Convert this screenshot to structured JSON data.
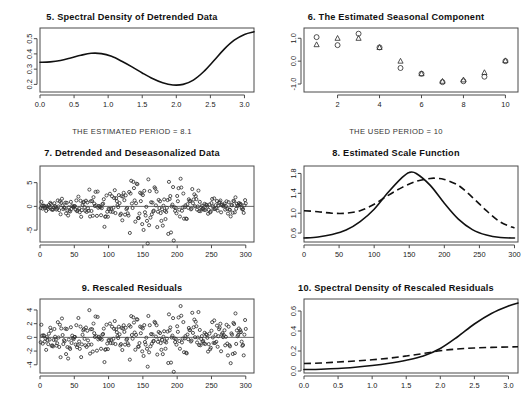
{
  "figure": {
    "background": "#ffffff",
    "ink": "#111111",
    "panel_count": 6
  },
  "captions": {
    "estimated_period": "THE ESTIMATED PERIOD = 8.1",
    "used_period": "THE USED PERIOD = 10"
  },
  "chart_data": [
    {
      "id": "panel5",
      "type": "line",
      "title": "5. Spectral Density of Detrended Data",
      "xlabel": "",
      "ylabel": "",
      "xlim": [
        0.0,
        3.14
      ],
      "ylim": [
        0.15,
        0.57
      ],
      "xticks": [
        0.0,
        0.5,
        1.0,
        1.5,
        2.0,
        2.5,
        3.0
      ],
      "xticklabels": [
        "0.0",
        "0.5",
        "1.0",
        "1.5",
        "2.0",
        "2.5",
        "3.0"
      ],
      "yticks": [
        0.2,
        0.3,
        0.4,
        0.5
      ],
      "yticklabels": [
        "0.2",
        "0.3",
        "0.4",
        "0.5"
      ],
      "grid": false,
      "legend": "none",
      "series": [
        {
          "name": "spectral density",
          "style": "solid",
          "x": [
            0.0,
            0.15,
            0.3,
            0.45,
            0.6,
            0.75,
            0.9,
            1.05,
            1.2,
            1.35,
            1.5,
            1.65,
            1.8,
            1.95,
            2.1,
            2.25,
            2.4,
            2.55,
            2.7,
            2.85,
            3.0,
            3.14
          ],
          "y": [
            0.345,
            0.348,
            0.357,
            0.373,
            0.391,
            0.404,
            0.402,
            0.384,
            0.352,
            0.315,
            0.275,
            0.238,
            0.21,
            0.196,
            0.2,
            0.228,
            0.283,
            0.355,
            0.43,
            0.49,
            0.528,
            0.545
          ]
        }
      ]
    },
    {
      "id": "panel6",
      "type": "scatter",
      "title": "6. The Estimated Seasonal Component",
      "xlabel": "",
      "ylabel": "",
      "xlim": [
        0.4,
        10.6
      ],
      "ylim": [
        -1.35,
        1.45
      ],
      "xticks": [
        2,
        4,
        6,
        8,
        10
      ],
      "xticklabels": [
        "2",
        "4",
        "6",
        "8",
        "10"
      ],
      "yticks": [
        -1.0,
        0.0,
        1.0
      ],
      "yticklabels": [
        "-1.0",
        "0.0",
        "1.0"
      ],
      "grid": false,
      "legend": "none",
      "series": [
        {
          "name": "circles",
          "marker": "circle",
          "x": [
            1,
            2,
            3,
            4,
            5,
            6,
            7,
            8,
            9,
            10
          ],
          "y": [
            1.05,
            0.7,
            1.2,
            0.6,
            -0.3,
            -0.55,
            -0.92,
            -0.88,
            -0.68,
            0.0
          ]
        },
        {
          "name": "triangles",
          "marker": "triangle",
          "x": [
            1,
            2,
            3,
            4,
            5,
            6,
            7,
            8,
            9,
            10
          ],
          "y": [
            0.72,
            1.0,
            1.0,
            0.6,
            0.0,
            -0.55,
            -0.88,
            -0.82,
            -0.5,
            0.02
          ]
        }
      ]
    },
    {
      "id": "panel7",
      "type": "scatter",
      "title": "7. Detrended and Deseasonalized Data",
      "xlabel": "",
      "ylabel": "",
      "xlim": [
        0,
        312
      ],
      "ylim": [
        -7.5,
        8.5
      ],
      "xticks": [
        0,
        50,
        100,
        150,
        200,
        250,
        300
      ],
      "xticklabels": [
        "0",
        "50",
        "100",
        "150",
        "200",
        "250",
        "300"
      ],
      "yticks": [
        -5,
        0,
        5
      ],
      "yticklabels": [
        "-5",
        "0",
        "5"
      ],
      "grid": false,
      "legend": "none",
      "reference_line": 0,
      "n_points": 300,
      "noise_scale_profile": "rises to a maximum near index 150-230 then falls",
      "series": [
        {
          "name": "detrended deseasonalized residuals",
          "marker": "circle",
          "description": "~300 open circles scattered about zero; spread widest near index 150-235 with extremes near +7 at 205 and -6 at 157"
        }
      ]
    },
    {
      "id": "panel8",
      "type": "line",
      "title": "8. Estimated Scale Function",
      "xlabel": "",
      "ylabel": "",
      "xlim": [
        0,
        305
      ],
      "ylim": [
        0.42,
        1.95
      ],
      "xticks": [
        0,
        50,
        100,
        150,
        200,
        250,
        300
      ],
      "xticklabels": [
        "0",
        "50",
        "100",
        "150",
        "200",
        "250",
        "300"
      ],
      "yticks": [
        0.6,
        1.0,
        1.4,
        1.8
      ],
      "yticklabels": [
        "0.6",
        "1.0",
        "1.4",
        "1.8"
      ],
      "grid": false,
      "legend": "none",
      "series": [
        {
          "name": "true scale function",
          "style": "solid",
          "x": [
            0,
            20,
            40,
            60,
            80,
            100,
            120,
            140,
            150,
            160,
            180,
            200,
            220,
            240,
            260,
            280,
            300
          ],
          "y": [
            0.5,
            0.52,
            0.57,
            0.66,
            0.83,
            1.08,
            1.42,
            1.72,
            1.82,
            1.8,
            1.56,
            1.2,
            0.88,
            0.67,
            0.56,
            0.51,
            0.5
          ]
        },
        {
          "name": "estimated scale function",
          "style": "dashed",
          "x": [
            0,
            20,
            40,
            60,
            80,
            100,
            120,
            140,
            160,
            180,
            190,
            200,
            220,
            240,
            260,
            280,
            300
          ],
          "y": [
            1.05,
            1.03,
            1.0,
            1.0,
            1.05,
            1.18,
            1.36,
            1.52,
            1.64,
            1.7,
            1.7,
            1.68,
            1.56,
            1.32,
            1.05,
            0.82,
            0.7
          ]
        }
      ]
    },
    {
      "id": "panel9",
      "type": "scatter",
      "title": "9. Rescaled Residuals",
      "xlabel": "",
      "ylabel": "",
      "xlim": [
        0,
        312
      ],
      "ylim": [
        -5.2,
        5.6
      ],
      "xticks": [
        0,
        50,
        100,
        150,
        200,
        250,
        300
      ],
      "xticklabels": [
        "0",
        "50",
        "100",
        "150",
        "200",
        "250",
        "300"
      ],
      "yticks": [
        -4,
        -2,
        0,
        2,
        4
      ],
      "yticklabels": [
        "-4",
        "-2",
        "0",
        "2",
        "4"
      ],
      "grid": false,
      "legend": "none",
      "reference_line": 0,
      "n_points": 300,
      "series": [
        {
          "name": "rescaled residuals",
          "marker": "circle",
          "description": "~300 open circles roughly homoscedastic about zero, extremes near +5 at 205 and -4.6 at 157"
        }
      ]
    },
    {
      "id": "panel10",
      "type": "line",
      "title": "10. Spectral Density of Rescaled Residuals",
      "xlabel": "",
      "ylabel": "",
      "xlim": [
        0.0,
        3.14
      ],
      "ylim": [
        -0.02,
        0.72
      ],
      "xticks": [
        0.0,
        0.5,
        1.0,
        1.5,
        2.0,
        2.5,
        3.0
      ],
      "xticklabels": [
        "0.0",
        "0.5",
        "1.0",
        "1.5",
        "2.0",
        "2.5",
        "3.0"
      ],
      "yticks": [
        0.0,
        0.2,
        0.4,
        0.6
      ],
      "yticklabels": [
        "0.0",
        "0.2",
        "0.4",
        "0.6"
      ],
      "grid": false,
      "legend": "none",
      "series": [
        {
          "name": "estimated spectral density",
          "style": "solid",
          "x": [
            0.0,
            0.25,
            0.5,
            0.75,
            1.0,
            1.25,
            1.5,
            1.75,
            2.0,
            2.25,
            2.5,
            2.75,
            3.0,
            3.14
          ],
          "y": [
            0.015,
            0.018,
            0.025,
            0.038,
            0.055,
            0.078,
            0.108,
            0.15,
            0.225,
            0.34,
            0.47,
            0.575,
            0.65,
            0.68
          ]
        },
        {
          "name": "reference spectral density",
          "style": "dashed",
          "x": [
            0.0,
            0.25,
            0.5,
            0.75,
            1.0,
            1.25,
            1.5,
            1.75,
            2.0,
            2.25,
            2.5,
            2.75,
            3.0,
            3.14
          ],
          "y": [
            0.075,
            0.08,
            0.09,
            0.1,
            0.112,
            0.128,
            0.15,
            0.175,
            0.202,
            0.22,
            0.23,
            0.236,
            0.24,
            0.242
          ]
        }
      ]
    }
  ]
}
